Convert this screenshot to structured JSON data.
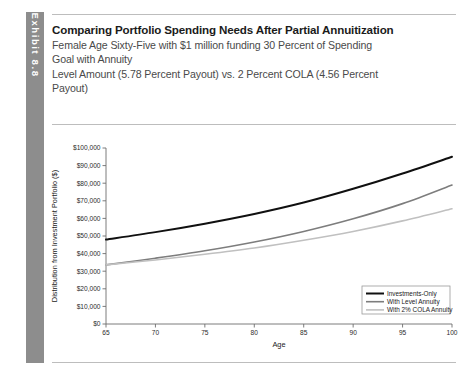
{
  "exhibit": {
    "tab_label": "Exhibit 8.8"
  },
  "header": {
    "title": "Comparing Portfolio Spending Needs After Partial Annuitization",
    "subtitle_line1": "Female Age Sixty-Five with $1 million funding 30 Percent of Spending",
    "subtitle_line2": "Goal with Annuity",
    "subtitle_line3": "Level Amount (5.78 Percent Payout) vs. 2 Percent COLA (4.56 Percent",
    "subtitle_line4": "Payout)"
  },
  "chart_data": {
    "type": "line",
    "title": "Comparing Portfolio Spending Needs After Partial Annuitization",
    "xlabel": "Age",
    "ylabel": "Distribution from Investment Portfolio ($)",
    "xlim": [
      65,
      100
    ],
    "ylim": [
      0,
      100000
    ],
    "grid": false,
    "legend_position": "bottom-right",
    "x_ticks": [
      65,
      70,
      75,
      80,
      85,
      90,
      95,
      100
    ],
    "x_tick_labels": [
      "65",
      "70",
      "75",
      "80",
      "85",
      "90",
      "95",
      "100"
    ],
    "y_ticks": [
      0,
      10000,
      20000,
      30000,
      40000,
      50000,
      60000,
      70000,
      80000,
      90000,
      100000
    ],
    "y_tick_labels": [
      "$0",
      "$10,000",
      "$20,000",
      "$30,000",
      "$40,000",
      "$50,000",
      "$60,000",
      "$70,000",
      "$80,000",
      "$90,000",
      "$100,000"
    ],
    "x": [
      65,
      70,
      75,
      80,
      85,
      90,
      95,
      100
    ],
    "series": [
      {
        "name": "Investments-Only",
        "color": "#101010",
        "width": 2.0,
        "values": [
          48000,
          52200,
          57000,
          62500,
          69000,
          76800,
          85500,
          95000
        ]
      },
      {
        "name": "With Level Annuity",
        "color": "#7d7d7d",
        "width": 1.6,
        "values": [
          33600,
          37400,
          41600,
          46600,
          52600,
          59800,
          68400,
          79000
        ]
      },
      {
        "name": "With 2% COLA Annuity",
        "color": "#c0c0c0",
        "width": 1.6,
        "values": [
          33600,
          36400,
          39600,
          43200,
          47600,
          52600,
          58600,
          65500
        ]
      }
    ]
  }
}
